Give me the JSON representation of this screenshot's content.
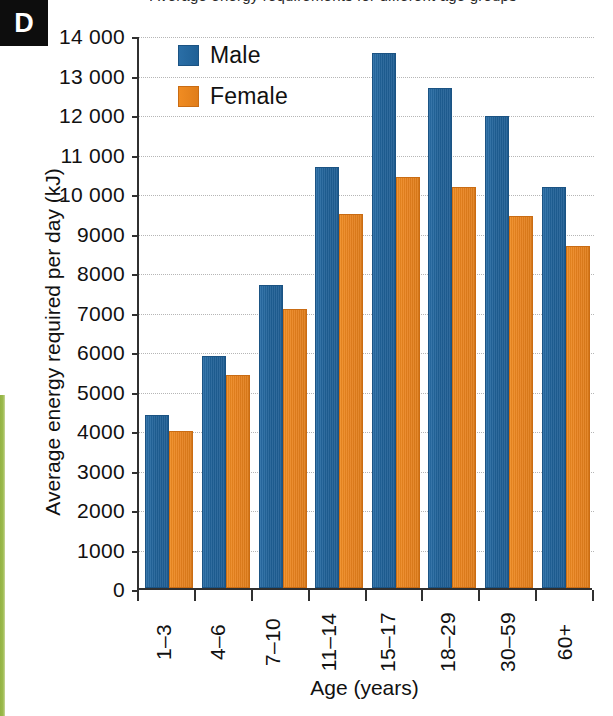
{
  "panel": {
    "letter": "D"
  },
  "caption": {
    "clipped_text": "Average energy requirements for different age groups"
  },
  "legend": {
    "items": [
      {
        "label": "Male",
        "color": "#1f6096",
        "icon": "square-swatch-icon"
      },
      {
        "label": "Female",
        "color": "#e8821e",
        "icon": "square-swatch-icon"
      }
    ]
  },
  "axes": {
    "y_title": "Average energy required per day (kJ)",
    "x_title": "Age (years)",
    "y_ticklabels": [
      "14 000",
      "13 000",
      "12 000",
      "11 000",
      "10 000",
      "9000",
      "8000",
      "7000",
      "6000",
      "5000",
      "4000",
      "3000",
      "2000",
      "1000",
      "0"
    ],
    "y_tickvalues": [
      14000,
      13000,
      12000,
      11000,
      10000,
      9000,
      8000,
      7000,
      6000,
      5000,
      4000,
      3000,
      2000,
      1000,
      0
    ]
  },
  "chart_data": {
    "type": "bar",
    "title": "Average energy requirements for different age groups",
    "xlabel": "Age (years)",
    "ylabel": "Average energy required per day (kJ)",
    "categories": [
      "1–3",
      "4–6",
      "7–10",
      "11–14",
      "15–17",
      "18–29",
      "30–59",
      "60+"
    ],
    "series": [
      {
        "name": "Male",
        "color": "#1f6096",
        "values": [
          4400,
          5900,
          7700,
          10700,
          13600,
          12700,
          12000,
          10200
        ]
      },
      {
        "name": "Female",
        "color": "#e8821e",
        "values": [
          4000,
          5400,
          7100,
          9500,
          10450,
          10200,
          9450,
          8700
        ]
      }
    ],
    "ylim": [
      0,
      14000
    ],
    "ytick_step": 1000,
    "grid": true,
    "legend_position": "top-left"
  }
}
